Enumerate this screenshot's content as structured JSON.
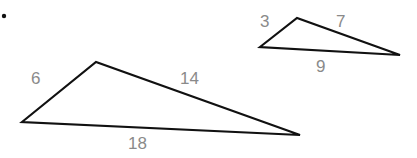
{
  "diagram": {
    "bullet": {
      "x": 4,
      "y": 16,
      "r": 2.2
    },
    "stroke_color": "#111111",
    "label_color": "#8a8a8a",
    "triangles": [
      {
        "name": "large-triangle",
        "vertices": [
          [
            22,
            122
          ],
          [
            96,
            62
          ],
          [
            300,
            135
          ]
        ],
        "labels": [
          {
            "side": "left",
            "text": "6",
            "x": 31,
            "y": 70
          },
          {
            "side": "top-right",
            "text": "14",
            "x": 180,
            "y": 70
          },
          {
            "side": "bottom",
            "text": "18",
            "x": 128,
            "y": 135
          }
        ]
      },
      {
        "name": "small-triangle",
        "vertices": [
          [
            260,
            47
          ],
          [
            297,
            18
          ],
          [
            400,
            55
          ]
        ],
        "labels": [
          {
            "side": "left",
            "text": "3",
            "x": 260,
            "y": 13
          },
          {
            "side": "top-right",
            "text": "7",
            "x": 336,
            "y": 13
          },
          {
            "side": "bottom",
            "text": "9",
            "x": 316,
            "y": 58
          }
        ]
      }
    ]
  }
}
